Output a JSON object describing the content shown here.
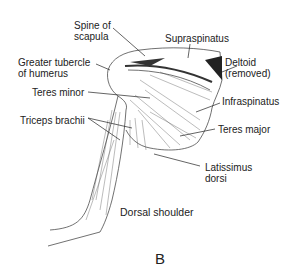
{
  "figure": {
    "panel_letter": "B",
    "caption": "Dorsal shoulder",
    "labels": {
      "spine_of_scapula": "Spine of\nscapula",
      "supraspinatus": "Supraspinatus",
      "greater_tubercle": "Greater tubercle\nof humerus",
      "deltoid_removed": "Deltoid\n(removed)",
      "teres_minor": "Teres minor",
      "infraspinatus": "Infraspinatus",
      "triceps_brachii": "Triceps brachii",
      "teres_major": "Teres major",
      "latissimus_dorsi": "Latissimus\ndorsi"
    }
  }
}
